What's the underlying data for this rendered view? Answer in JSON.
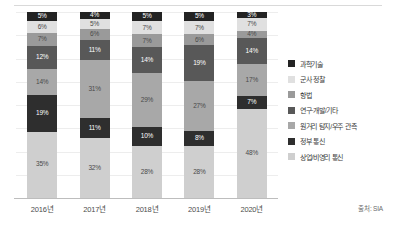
{
  "chart_data": {
    "type": "bar",
    "stacked": true,
    "stack_mode": "percent",
    "title": "",
    "subtitle": "",
    "xlabel": "",
    "ylabel": "",
    "ylim": [
      0,
      100
    ],
    "grid": true,
    "legend_position": "right",
    "categories": [
      "2016년",
      "2017년",
      "2018년",
      "2019년",
      "2020년"
    ],
    "series": [
      {
        "name": "상업/비영리 통신",
        "color": "#cfcfcf",
        "values": [
          35,
          32,
          28,
          28,
          48
        ],
        "labels": [
          "35%",
          "32%",
          "28%",
          "28%",
          "48%"
        ]
      },
      {
        "name": "정부 통신",
        "color": "#2e2e2e",
        "values": [
          19,
          11,
          10,
          8,
          7
        ],
        "labels": [
          "19%",
          "11%",
          "10%",
          "8%",
          "7%"
        ]
      },
      {
        "name": "원거리 탐지/우주 관측",
        "color": "#a8a8a8",
        "values": [
          14,
          31,
          29,
          27,
          17
        ],
        "labels": [
          "14%",
          "31%",
          "29%",
          "27%",
          "17%"
        ]
      },
      {
        "name": "연구·개발/기타",
        "color": "#585858",
        "values": [
          12,
          11,
          14,
          19,
          14
        ],
        "labels": [
          "12%",
          "11%",
          "14%",
          "19%",
          "14%"
        ]
      },
      {
        "name": "항법",
        "color": "#9a9a9a",
        "values": [
          7,
          6,
          7,
          6,
          4
        ],
        "labels": [
          "7%",
          "6%",
          "7%",
          "6%",
          "4%"
        ]
      },
      {
        "name": "군사 정찰",
        "color": "#e0e0e0",
        "values": [
          6,
          5,
          7,
          7,
          7
        ],
        "labels": [
          "6%",
          "5%",
          "7%",
          "7%",
          "7%"
        ]
      },
      {
        "name": "과학기술",
        "color": "#232323",
        "values": [
          5,
          4,
          5,
          5,
          3
        ],
        "labels": [
          "5%",
          "4%",
          "5%",
          "5%",
          "3%"
        ]
      }
    ],
    "legend_entries": [
      "과학기술",
      "군사 정찰",
      "항법",
      "연구·개발/기타",
      "원거리 탐지/우주 관측",
      "정부 통신",
      "상업/비영리 통신"
    ]
  },
  "source": {
    "text": "출처: SIA"
  },
  "colors": {
    "science_tech": "#232323",
    "military_recon": "#e0e0e0",
    "navigation": "#9a9a9a",
    "rnd_other": "#585858",
    "remote_sensing": "#a8a8a8",
    "gov_comm": "#2e2e2e",
    "commercial_comm": "#cfcfcf",
    "gridline": "#ededed",
    "axis": "#bdbdbd",
    "background": "#ffffff"
  }
}
